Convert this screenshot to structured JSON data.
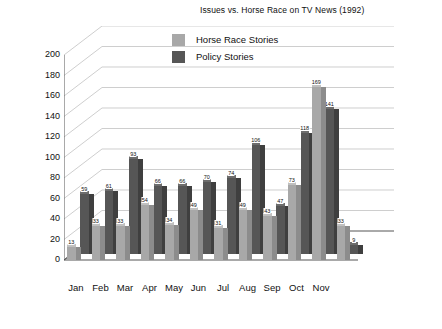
{
  "chart_data": {
    "type": "bar",
    "title": "Issues vs. Horse Race on TV News (1992)",
    "xlabel": "",
    "ylabel": "Number of Stories",
    "ylim": [
      0,
      200
    ],
    "ytick_step": 20,
    "yticks": [
      "0",
      "20",
      "40",
      "60",
      "80",
      "100",
      "120",
      "140",
      "160",
      "180",
      "200"
    ],
    "grid": true,
    "legend_position": "top-center",
    "categories": [
      "Jan",
      "Feb",
      "Mar",
      "Apr",
      "May",
      "Jun",
      "Jul",
      "Aug",
      "Sep",
      "Oct",
      "Nov",
      ""
    ],
    "series": [
      {
        "name": "Horse Race  Stories",
        "color": "#a8a8a8",
        "values": [
          13,
          33,
          33,
          54,
          34,
          49,
          31,
          49,
          43,
          73,
          169,
          33
        ]
      },
      {
        "name": "Policy Stories",
        "color": "#565656",
        "values": [
          59,
          61,
          93,
          66,
          66,
          70,
          74,
          106,
          47,
          118,
          141,
          9
        ]
      }
    ]
  },
  "legend": {
    "items": [
      {
        "label": "Horse Race  Stories",
        "swatch": "light"
      },
      {
        "label": "Policy Stories",
        "swatch": "dark"
      }
    ]
  }
}
